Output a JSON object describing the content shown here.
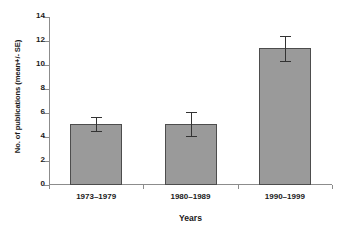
{
  "chart_data": {
    "type": "bar",
    "title": "",
    "xlabel": "Years",
    "ylabel": "No. of publications (mean+/- SE)",
    "categories": [
      "1973–1979",
      "1980–1989",
      "1990–1999"
    ],
    "values": [
      5.1,
      5.05,
      11.4
    ],
    "errors": [
      0.6,
      1.0,
      1.05
    ],
    "ylim": [
      0,
      14
    ],
    "yticks": [
      0,
      2,
      4,
      6,
      8,
      10,
      12,
      14
    ],
    "yticklabels": [
      "0",
      "2",
      "4",
      "6",
      "8",
      "10",
      "12",
      "14"
    ],
    "grid": false,
    "legend": false,
    "series": [
      {
        "name": "No. of publications",
        "values": [
          5.1,
          5.05,
          11.4
        ],
        "errors": [
          0.6,
          1.0,
          1.05
        ]
      }
    ],
    "colors": {
      "bar_fill": "#9a9a9a",
      "bar_edge": "#4d4d4d",
      "axis": "#8c8c8c",
      "error_bar": "#333333",
      "background": "#ffffff",
      "text": "#1a1a1a"
    }
  }
}
